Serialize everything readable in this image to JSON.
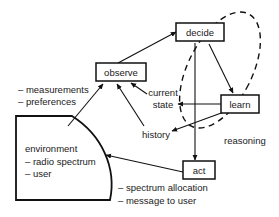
{
  "diagram": {
    "nodes": [
      {
        "id": "observe",
        "label": "observe"
      },
      {
        "id": "decide",
        "label": "decide"
      },
      {
        "id": "learn",
        "label": "learn"
      },
      {
        "id": "act",
        "label": "act"
      }
    ],
    "labels": {
      "measurements": "– measurements",
      "preferences": "– preferences",
      "current_state_line1": "current",
      "current_state_line2": "state",
      "history": "history",
      "reasoning": "reasoning",
      "environment": "environment",
      "radio_spectrum": "– radio spectrum",
      "user": "– user",
      "spectrum_allocation": "– spectrum allocation",
      "message_to_user": "– message to user"
    },
    "colors": {
      "ink": "#111111",
      "paper": "#ffffff"
    }
  }
}
